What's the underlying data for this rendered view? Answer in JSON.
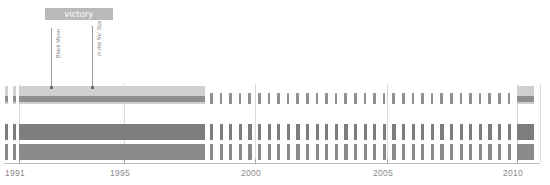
{
  "banner": {
    "label": "victory",
    "x": 45,
    "y": 8,
    "width": 68,
    "height": 12,
    "bg": "#b9b9b9",
    "color": "#ffffff"
  },
  "annotations": [
    {
      "name": "black-moon",
      "label": "Black Moon",
      "x": 51,
      "y_top": 28,
      "y_bottom": 88,
      "italic": false
    },
    {
      "name": "in-the-nu-star",
      "label": "In the Nu' Star",
      "x": 92,
      "y_top": 26,
      "y_bottom": 88,
      "italic": true
    }
  ],
  "axis": {
    "y": 163,
    "x_start": 4,
    "x_end": 540,
    "label_y": 168,
    "labels": [
      "1991",
      "1995",
      "2000",
      "2005",
      "2010"
    ],
    "label_x": [
      19,
      124,
      255,
      387,
      517
    ],
    "ticks_major_x": [
      19,
      124,
      255,
      387,
      517
    ],
    "color": "#8a8a8a"
  },
  "chart_data": {
    "type": "bar",
    "title": "victory",
    "xlabel": "",
    "ylabel": "",
    "xlim": [
      1991,
      2010.5
    ],
    "grid": true,
    "legend": null,
    "annotations": [
      {
        "text": "Black Moon",
        "x": 1991.3
      },
      {
        "text": "In the Nu' Star",
        "x": 1992.9
      },
      {
        "text": "victory",
        "x_start": 1991.0,
        "x_end": 1993.6
      }
    ],
    "x_tick_labels": [
      "1991",
      "1995",
      "2000",
      "2005",
      "2010"
    ],
    "x_tick_values": [
      1991,
      1995,
      2000,
      2005,
      2010
    ],
    "rows": [
      {
        "name": "row-1",
        "y": 86,
        "height": 18,
        "color": "#cfcfcf",
        "stripe_color": "#8f8f8f",
        "stripe_offset": 10,
        "stripe_height": 6,
        "continuous": [
          {
            "x_start": 5,
            "x_end": 8
          },
          {
            "x_start": 13,
            "x_end": 16
          },
          {
            "x_start": 19,
            "x_end": 205
          }
        ],
        "tick_start": 210,
        "tick_end": 514,
        "tick_spacing": 9.6,
        "tick_width": 2.6,
        "end_block": {
          "x_start": 517,
          "x_end": 534
        }
      },
      {
        "name": "row-2",
        "y": 124,
        "height": 16,
        "color": "#7d7d7d",
        "stripe_color": "#7d7d7d",
        "stripe_offset": 0,
        "stripe_height": 16,
        "continuous": [
          {
            "x_start": 5,
            "x_end": 8
          },
          {
            "x_start": 13,
            "x_end": 16
          },
          {
            "x_start": 19,
            "x_end": 205
          }
        ],
        "tick_start": 210,
        "tick_end": 514,
        "tick_spacing": 9.6,
        "tick_width": 3.2,
        "end_block": {
          "x_start": 517,
          "x_end": 534
        }
      },
      {
        "name": "row-3",
        "y": 144,
        "height": 16,
        "color": "#8a8a8a",
        "stripe_color": "#8a8a8a",
        "stripe_offset": 0,
        "stripe_height": 16,
        "continuous": [
          {
            "x_start": 5,
            "x_end": 8
          },
          {
            "x_start": 13,
            "x_end": 16
          },
          {
            "x_start": 19,
            "x_end": 205
          }
        ],
        "tick_start": 210,
        "tick_end": 514,
        "tick_spacing": 9.6,
        "tick_width": 3.2,
        "end_block": {
          "x_start": 517,
          "x_end": 534
        }
      }
    ],
    "gridlines_x": [
      19,
      124,
      255,
      387,
      517,
      540
    ],
    "grid_color": "#d9d9d9",
    "grid_top": 84,
    "grid_bottom": 162
  }
}
